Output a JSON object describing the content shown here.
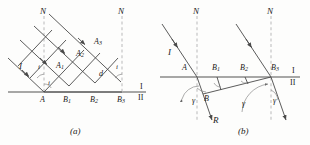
{
  "figure": {
    "caption_a": "(a)",
    "caption_b": "(b)"
  },
  "colors": {
    "ray": "#4a4a4a",
    "interface": "#8a8a8a",
    "normal_dashed": "#b9b9b9",
    "text": "#1a1a1a",
    "arc": "#8a8a8a"
  },
  "panel_a": {
    "caption": "(a)",
    "normals": [
      {
        "name": "N",
        "label": "N",
        "x": 44,
        "y_top": 12
      },
      {
        "name": "N",
        "label": "N",
        "x": 122,
        "y_top": 12
      }
    ],
    "incident_ray_label": "I",
    "angle_labels": [
      {
        "label": "i",
        "at": "near-A-above-interface"
      },
      {
        "label": "i",
        "at": "at-A-on-interface"
      },
      {
        "label": "i",
        "at": "near-B3-upper"
      }
    ],
    "wavefront_points": [
      {
        "label": "A",
        "sub": "1"
      },
      {
        "label": "A",
        "sub": "2"
      },
      {
        "label": "A",
        "sub": "3"
      }
    ],
    "spacing_label": "d",
    "interface_points": [
      {
        "label": "A",
        "sub": ""
      },
      {
        "label": "B",
        "sub": "1"
      },
      {
        "label": "B",
        "sub": "2"
      },
      {
        "label": "B",
        "sub": "3"
      }
    ],
    "media": {
      "upper": "I",
      "lower": "II"
    }
  },
  "panel_b": {
    "caption": "(b)",
    "normals": [
      {
        "name": "N",
        "label": "N",
        "x": 197,
        "y_top": 12
      },
      {
        "name": "N",
        "label": "N",
        "x": 271,
        "y_top": 12
      }
    ],
    "incident_ray_label": "I",
    "refracted_ray_label": "R",
    "interface_points": [
      {
        "label": "A",
        "sub": ""
      },
      {
        "label": "B",
        "sub": "1"
      },
      {
        "label": "B",
        "sub": "2"
      },
      {
        "label": "B",
        "sub": "3"
      }
    ],
    "wavelet_point": {
      "label": "B",
      "sub": ""
    },
    "angle_labels": [
      {
        "label": "γ",
        "at": "left-below-interface"
      },
      {
        "label": "γ",
        "at": "middle-below-interface"
      },
      {
        "label": "γ",
        "at": "right-below-interface"
      }
    ],
    "media": {
      "upper": "I",
      "lower": "II"
    }
  }
}
